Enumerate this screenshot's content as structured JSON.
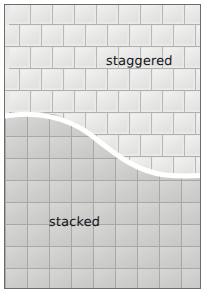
{
  "figure": {
    "width": 205,
    "height": 293,
    "background": "#ffffff",
    "frame": {
      "border_color": "#6d6d6d",
      "border_width": 1
    }
  },
  "regions": [
    {
      "id": "staggered",
      "label": "staggered",
      "pattern": "running-bond",
      "position": "upper",
      "tile_fill": "#e9e9e7",
      "grout_color": "#b9b9b7",
      "tile_width": 22,
      "tile_height": 22,
      "row_offset": 11,
      "label_x": 101,
      "label_y": 48
    },
    {
      "id": "stacked",
      "label": "stacked",
      "pattern": "stacked-grid",
      "position": "lower",
      "tile_fill": "#cfcfcd",
      "grout_color": "#a8a8a6",
      "tile_width": 22,
      "tile_height": 22,
      "row_offset": 0,
      "label_x": 44,
      "label_y": 209
    }
  ],
  "divider": {
    "id": "s-curve",
    "name": "region-divider-curve",
    "color": "#ffffff",
    "stroke_width": 5,
    "path": "M -6 112 C 30 105, 62 112, 86 130 C 110 149, 130 166, 160 170 C 180 172, 195 171, 212 169",
    "description": "white S-shaped curve separating staggered tile field above from stacked tile field below"
  },
  "colors": {
    "staggered_tile": "#e9e9e7",
    "staggered_grout": "#b9b9b7",
    "stacked_tile": "#cfcfcd",
    "stacked_grout": "#a8a8a6",
    "divider": "#ffffff",
    "frame_border": "#6d6d6d",
    "label_text": "#15151a",
    "page_background": "#ffffff"
  }
}
